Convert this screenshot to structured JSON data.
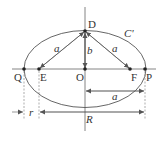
{
  "diagram": {
    "title": "",
    "colors": {
      "stroke": "#555555",
      "text": "#333333",
      "background": "#ffffff"
    },
    "points": [
      {
        "id": "D",
        "label": "D"
      },
      {
        "id": "Q",
        "label": "Q"
      },
      {
        "id": "E",
        "label": "E"
      },
      {
        "id": "O",
        "label": "O"
      },
      {
        "id": "F",
        "label": "F"
      },
      {
        "id": "P",
        "label": "P"
      }
    ],
    "curve_label": "C'",
    "segments": {
      "DE": "a",
      "DF": "a",
      "DO": "b"
    },
    "dimensions": {
      "a": "a",
      "r": "r",
      "R": "R"
    }
  }
}
